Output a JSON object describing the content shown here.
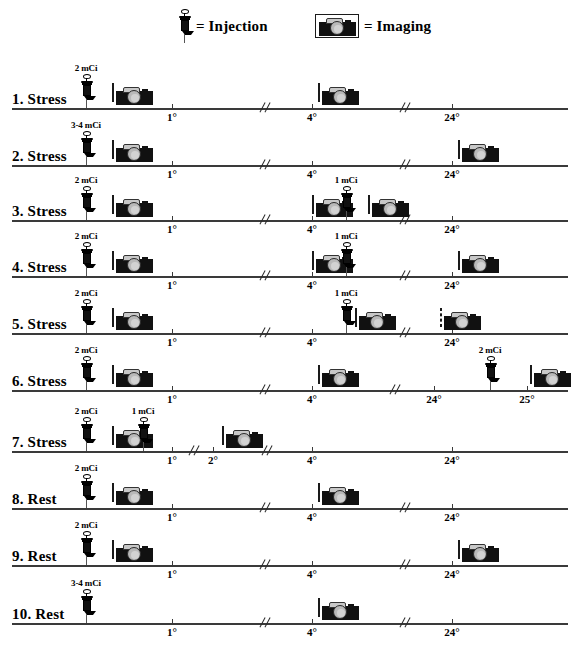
{
  "legend": {
    "injection": {
      "icon": "syringe-icon",
      "equals": "=",
      "label": "Injection"
    },
    "imaging": {
      "icon": "camera-icon",
      "equals": "=",
      "label": "Imaging"
    }
  },
  "units": {
    "dose_unit": "mCi",
    "time_unit": "°"
  },
  "colors": {
    "axis": "#3a3a3a",
    "ink": "#000000",
    "camera_body": "#111111",
    "camera_lens": "#b9b9b9",
    "background": "#ffffff"
  },
  "protocols": [
    {
      "label": "1. Stress",
      "type": "Stress",
      "ticks": [
        {
          "label": "1°",
          "x": 172
        },
        {
          "label": "4°",
          "x": 312
        },
        {
          "label": "24°",
          "x": 452
        }
      ],
      "breaks": [
        266,
        406
      ],
      "injections": [
        {
          "dose": "2 mCi",
          "x": 80
        }
      ],
      "imagings": [
        {
          "x": 112,
          "dashed": false
        },
        {
          "x": 318,
          "dashed": false
        }
      ]
    },
    {
      "label": "2. Stress",
      "type": "Stress",
      "ticks": [
        {
          "label": "1°",
          "x": 172
        },
        {
          "label": "4°",
          "x": 312
        },
        {
          "label": "24°",
          "x": 452
        }
      ],
      "breaks": [
        266,
        406
      ],
      "injections": [
        {
          "dose": "3-4 mCi",
          "x": 80
        }
      ],
      "imagings": [
        {
          "x": 112,
          "dashed": false
        },
        {
          "x": 458,
          "dashed": false
        }
      ]
    },
    {
      "label": "3. Stress",
      "type": "Stress",
      "ticks": [
        {
          "label": "1°",
          "x": 172
        },
        {
          "label": "4°",
          "x": 312
        },
        {
          "label": "24°",
          "x": 452
        }
      ],
      "breaks": [
        266,
        406
      ],
      "injections": [
        {
          "dose": "2 mCi",
          "x": 80
        },
        {
          "dose": "1 mCi",
          "x": 340
        }
      ],
      "imagings": [
        {
          "x": 112,
          "dashed": false
        },
        {
          "x": 312,
          "dashed": false
        },
        {
          "x": 368,
          "dashed": false
        }
      ]
    },
    {
      "label": "4. Stress",
      "type": "Stress",
      "ticks": [
        {
          "label": "1°",
          "x": 172
        },
        {
          "label": "4°",
          "x": 312
        },
        {
          "label": "24°",
          "x": 452
        }
      ],
      "breaks": [
        266,
        406
      ],
      "injections": [
        {
          "dose": "2 mCi",
          "x": 80
        },
        {
          "dose": "1 mCi",
          "x": 340
        }
      ],
      "imagings": [
        {
          "x": 112,
          "dashed": false
        },
        {
          "x": 312,
          "dashed": false
        },
        {
          "x": 458,
          "dashed": false
        }
      ]
    },
    {
      "label": "5. Stress",
      "type": "Stress",
      "ticks": [
        {
          "label": "1°",
          "x": 172
        },
        {
          "label": "4°",
          "x": 312
        },
        {
          "label": "24°",
          "x": 452
        }
      ],
      "breaks": [
        266,
        406
      ],
      "injections": [
        {
          "dose": "2 mCi",
          "x": 80
        },
        {
          "dose": "1 mCi",
          "x": 340
        }
      ],
      "imagings": [
        {
          "x": 112,
          "dashed": false
        },
        {
          "x": 355,
          "dashed": false
        },
        {
          "x": 440,
          "dashed": true
        }
      ]
    },
    {
      "label": "6. Stress",
      "type": "Stress",
      "ticks": [
        {
          "label": "1°",
          "x": 172
        },
        {
          "label": "4°",
          "x": 312
        },
        {
          "label": "24°",
          "x": 434
        },
        {
          "label": "25°",
          "x": 527
        }
      ],
      "breaks": [
        266,
        396
      ],
      "injections": [
        {
          "dose": "2 mCi",
          "x": 80
        },
        {
          "dose": "2 mCi",
          "x": 484
        }
      ],
      "imagings": [
        {
          "x": 112,
          "dashed": false
        },
        {
          "x": 318,
          "dashed": false
        },
        {
          "x": 530,
          "dashed": false
        }
      ]
    },
    {
      "label": "7. Stress",
      "type": "Stress",
      "ticks": [
        {
          "label": "1°",
          "x": 172
        },
        {
          "label": "2°",
          "x": 213
        },
        {
          "label": "4°",
          "x": 312
        },
        {
          "label": "24°",
          "x": 452
        }
      ],
      "breaks": [
        195,
        268
      ],
      "injections": [
        {
          "dose": "2 mCi",
          "x": 80
        },
        {
          "dose": "1 mCi",
          "x": 137
        }
      ],
      "imagings": [
        {
          "x": 112,
          "dashed": false
        },
        {
          "x": 222,
          "dashed": false
        }
      ]
    },
    {
      "label": "8. Rest",
      "type": "Rest",
      "ticks": [
        {
          "label": "1°",
          "x": 172
        },
        {
          "label": "4°",
          "x": 312
        },
        {
          "label": "24°",
          "x": 452
        }
      ],
      "breaks": [
        266,
        406
      ],
      "injections": [
        {
          "dose": "2 mCi",
          "x": 80
        }
      ],
      "imagings": [
        {
          "x": 112,
          "dashed": false
        },
        {
          "x": 318,
          "dashed": false
        }
      ]
    },
    {
      "label": "9. Rest",
      "type": "Rest",
      "ticks": [
        {
          "label": "1°",
          "x": 172
        },
        {
          "label": "4°",
          "x": 312
        },
        {
          "label": "24°",
          "x": 452
        }
      ],
      "breaks": [
        266,
        406
      ],
      "injections": [
        {
          "dose": "2 mCi",
          "x": 80
        }
      ],
      "imagings": [
        {
          "x": 112,
          "dashed": false
        },
        {
          "x": 458,
          "dashed": false
        }
      ]
    },
    {
      "label": "10. Rest",
      "type": "Rest",
      "ticks": [
        {
          "label": "1°",
          "x": 172
        },
        {
          "label": "4°",
          "x": 312
        },
        {
          "label": "24°",
          "x": 452
        }
      ],
      "breaks": [
        266,
        406
      ],
      "injections": [
        {
          "dose": "3-4 mCi",
          "x": 80
        }
      ],
      "imagings": [
        {
          "x": 318,
          "dashed": false
        }
      ]
    }
  ],
  "layout": {
    "row_tops": [
      68,
      125,
      180,
      236,
      293,
      350,
      411,
      468,
      525,
      583
    ],
    "legend_injection_x": 178,
    "legend_imaging_x": 315
  }
}
